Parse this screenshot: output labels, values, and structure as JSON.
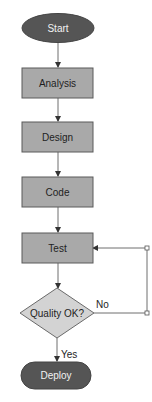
{
  "diagram": {
    "type": "flowchart",
    "nodes": [
      {
        "id": "start",
        "shape": "ellipse",
        "label": "Start"
      },
      {
        "id": "analysis",
        "shape": "rect",
        "label": "Analysis"
      },
      {
        "id": "design",
        "shape": "rect",
        "label": "Design"
      },
      {
        "id": "code",
        "shape": "rect",
        "label": "Code"
      },
      {
        "id": "test",
        "shape": "rect",
        "label": "Test"
      },
      {
        "id": "quality",
        "shape": "diamond",
        "label": "Quality OK?"
      },
      {
        "id": "deploy",
        "shape": "stadium",
        "label": "Deploy"
      }
    ],
    "edges": [
      {
        "from": "start",
        "to": "analysis",
        "label": ""
      },
      {
        "from": "analysis",
        "to": "design",
        "label": ""
      },
      {
        "from": "design",
        "to": "code",
        "label": ""
      },
      {
        "from": "code",
        "to": "test",
        "label": ""
      },
      {
        "from": "test",
        "to": "quality",
        "label": ""
      },
      {
        "from": "quality",
        "to": "test",
        "label": "No"
      },
      {
        "from": "quality",
        "to": "deploy",
        "label": "Yes"
      }
    ],
    "colors": {
      "terminal_fill": "#555555",
      "process_fill": "#a9a9a9",
      "decision_fill": "#d3d3d3",
      "stroke": "#5a5a5a",
      "edge": "#6e6e6e"
    }
  }
}
